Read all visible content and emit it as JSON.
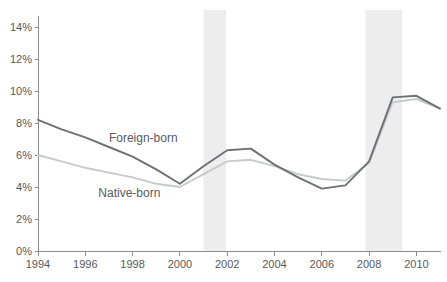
{
  "chart_data": {
    "type": "line",
    "title": "",
    "xlabel": "",
    "ylabel": "",
    "x": [
      1994,
      1995,
      1996,
      1997,
      1998,
      1999,
      2000,
      2001,
      2002,
      2003,
      2004,
      2005,
      2006,
      2007,
      2008,
      2009,
      2010,
      2011
    ],
    "series": [
      {
        "name": "Foreign-born",
        "color": "#6f7073",
        "stroke_width": 1.9,
        "values": [
          8.2,
          7.6,
          7.1,
          6.5,
          5.9,
          5.1,
          4.2,
          5.3,
          6.3,
          6.4,
          5.4,
          4.6,
          3.9,
          4.1,
          5.6,
          9.6,
          9.7,
          8.9
        ]
      },
      {
        "name": "Native-born",
        "color": "#c8c9cb",
        "stroke_width": 1.9,
        "values": [
          6.0,
          5.6,
          5.2,
          4.9,
          4.6,
          4.2,
          4.0,
          4.8,
          5.6,
          5.7,
          5.3,
          4.8,
          4.5,
          4.4,
          5.5,
          9.3,
          9.5,
          8.9
        ]
      }
    ],
    "xlim": [
      1994,
      2011
    ],
    "ylim": [
      0,
      14
    ],
    "grid": false,
    "legend": "inline-labels",
    "x_ticks": [
      {
        "value": 1994,
        "label": "1994"
      },
      {
        "value": 1996,
        "label": "1996"
      },
      {
        "value": 1998,
        "label": "1998"
      },
      {
        "value": 2000,
        "label": "2000"
      },
      {
        "value": 2002,
        "label": "2002"
      },
      {
        "value": 2004,
        "label": "2004"
      },
      {
        "value": 2006,
        "label": "2006"
      },
      {
        "value": 2008,
        "label": "2008"
      },
      {
        "value": 2010,
        "label": "2010"
      }
    ],
    "y_ticks": [
      {
        "value": 0,
        "label": "0%"
      },
      {
        "value": 2,
        "label": "2%"
      },
      {
        "value": 4,
        "label": "4%"
      },
      {
        "value": 6,
        "label": "6%"
      },
      {
        "value": 8,
        "label": "8%"
      },
      {
        "value": 10,
        "label": "10%"
      },
      {
        "value": 12,
        "label": "12%"
      },
      {
        "value": 14,
        "label": "14%"
      }
    ],
    "recession_bands": [
      {
        "start": 2001.0,
        "end": 2001.95
      },
      {
        "start": 2007.85,
        "end": 2009.4
      }
    ],
    "annotations": [
      {
        "text": "Foreign-born",
        "year": 1997.0,
        "pct": 7.05
      },
      {
        "text": "Native-born",
        "year": 1996.55,
        "pct": 3.62
      }
    ],
    "colors": {
      "background": "#ffffff",
      "band": "#ededed",
      "axis": "#8a8c8e",
      "tick_text": "#58595b",
      "annotation_text": "#595a5c"
    },
    "layout": {
      "plot_left": 38,
      "plot_right": 440,
      "plot_top": 27,
      "plot_bottom": 251,
      "axis_top": 16,
      "band_top": 10,
      "tick_len": 4,
      "x_label_baseline": 268,
      "y_label_right": 32,
      "tick_font_size": 11,
      "annotation_font_size": 12
    }
  }
}
